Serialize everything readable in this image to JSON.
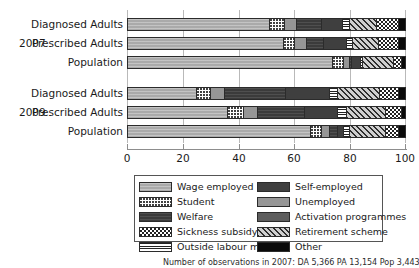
{
  "chart_data": {
    "type": "bar",
    "orientation": "horizontal",
    "stacked": true,
    "normalized_percent": true,
    "title": "",
    "xlabel": "",
    "ylabel": "",
    "xlim": [
      0,
      100
    ],
    "xticks": [
      0,
      20,
      40,
      60,
      80,
      100
    ],
    "xticklabels": [
      "0",
      "20",
      "40",
      "60",
      "80",
      "100"
    ],
    "grid": "vertical",
    "legend_position": "bottom",
    "groups": [
      {
        "year": "2007",
        "categories": [
          "Diagnosed Adults",
          "Prescribed Adults",
          "Population"
        ]
      },
      {
        "year": "2009",
        "categories": [
          "Diagnosed Adults",
          "Prescribed Adults",
          "Population"
        ]
      }
    ],
    "categories": [
      "2007 Diagnosed Adults",
      "2007 Prescribed Adults",
      "2007 Population",
      "2009 Diagnosed Adults",
      "2009 Prescribed Adults",
      "2009 Population"
    ],
    "series": [
      {
        "name": "Wage employed",
        "key": "wage",
        "values": [
          46,
          54,
          74,
          25,
          36,
          66
        ]
      },
      {
        "name": "Student",
        "key": "student",
        "values": [
          5,
          4,
          4,
          5,
          6,
          4
        ]
      },
      {
        "name": "Unemployed",
        "key": "unemployed",
        "values": [
          4,
          4,
          2,
          5,
          5,
          3
        ]
      },
      {
        "name": "Welfare",
        "key": "welfare",
        "values": [
          8,
          6,
          1,
          22,
          17,
          3
        ]
      },
      {
        "name": "Self-employed",
        "key": "selfemployed",
        "values": [
          7,
          8,
          3,
          16,
          12,
          2
        ]
      },
      {
        "name": "Outside labour market",
        "key": "outside",
        "values": [
          2,
          2,
          1,
          3,
          3,
          2
        ]
      },
      {
        "name": "Retirement scheme",
        "key": "retirement",
        "values": [
          9,
          9,
          11,
          15,
          14,
          13
        ]
      },
      {
        "name": "Sickness subsidy",
        "key": "sickness",
        "values": [
          7,
          7,
          3,
          7,
          6,
          5
        ]
      },
      {
        "name": "Other",
        "key": "other",
        "values": [
          2,
          2,
          1,
          2,
          1,
          2
        ]
      }
    ],
    "stack_order": [
      "wage",
      "student",
      "unemployed",
      "welfare",
      "selfemployed",
      "activation",
      "outside",
      "retirement",
      "sickness",
      "other"
    ],
    "bars": [
      {
        "label": "2007 Diagnosed Adults",
        "segments": [
          {
            "key": "wage",
            "value": 46
          },
          {
            "key": "student",
            "value": 5
          },
          {
            "key": "unemployed",
            "value": 4
          },
          {
            "key": "welfare",
            "value": 8
          },
          {
            "key": "selfemployed",
            "value": 7
          },
          {
            "key": "outside",
            "value": 2
          },
          {
            "key": "retirement",
            "value": 9
          },
          {
            "key": "sickness",
            "value": 7
          },
          {
            "key": "other",
            "value": 2
          }
        ]
      },
      {
        "label": "2007 Prescribed Adults",
        "segments": [
          {
            "key": "wage",
            "value": 54
          },
          {
            "key": "student",
            "value": 4
          },
          {
            "key": "unemployed",
            "value": 4
          },
          {
            "key": "welfare",
            "value": 6
          },
          {
            "key": "selfemployed",
            "value": 8
          },
          {
            "key": "outside",
            "value": 2
          },
          {
            "key": "retirement",
            "value": 9
          },
          {
            "key": "sickness",
            "value": 7
          },
          {
            "key": "other",
            "value": 2
          }
        ]
      },
      {
        "label": "2007 Population",
        "segments": [
          {
            "key": "wage",
            "value": 74
          },
          {
            "key": "student",
            "value": 4
          },
          {
            "key": "unemployed",
            "value": 2
          },
          {
            "key": "welfare",
            "value": 1
          },
          {
            "key": "selfemployed",
            "value": 3
          },
          {
            "key": "outside",
            "value": 1
          },
          {
            "key": "retirement",
            "value": 11
          },
          {
            "key": "sickness",
            "value": 3
          },
          {
            "key": "other",
            "value": 1
          }
        ]
      },
      {
        "label": "2009 Diagnosed Adults",
        "segments": [
          {
            "key": "wage",
            "value": 25
          },
          {
            "key": "student",
            "value": 5
          },
          {
            "key": "unemployed",
            "value": 5
          },
          {
            "key": "welfare",
            "value": 22
          },
          {
            "key": "selfemployed",
            "value": 16
          },
          {
            "key": "outside",
            "value": 3
          },
          {
            "key": "retirement",
            "value": 15
          },
          {
            "key": "sickness",
            "value": 7
          },
          {
            "key": "other",
            "value": 2
          }
        ]
      },
      {
        "label": "2009 Prescribed Adults",
        "segments": [
          {
            "key": "wage",
            "value": 36
          },
          {
            "key": "student",
            "value": 6
          },
          {
            "key": "unemployed",
            "value": 5
          },
          {
            "key": "welfare",
            "value": 17
          },
          {
            "key": "selfemployed",
            "value": 12
          },
          {
            "key": "outside",
            "value": 3
          },
          {
            "key": "retirement",
            "value": 14
          },
          {
            "key": "sickness",
            "value": 6
          },
          {
            "key": "other",
            "value": 1
          }
        ]
      },
      {
        "label": "2009 Population",
        "segments": [
          {
            "key": "wage",
            "value": 66
          },
          {
            "key": "student",
            "value": 4
          },
          {
            "key": "unemployed",
            "value": 3
          },
          {
            "key": "welfare",
            "value": 3
          },
          {
            "key": "selfemployed",
            "value": 2
          },
          {
            "key": "outside",
            "value": 2
          },
          {
            "key": "retirement",
            "value": 13
          },
          {
            "key": "sickness",
            "value": 5
          },
          {
            "key": "other",
            "value": 2
          }
        ]
      }
    ],
    "legend": [
      {
        "label": "Wage employed",
        "key": "wage"
      },
      {
        "label": "Self-employed",
        "key": "selfemployed"
      },
      {
        "label": "Student",
        "key": "student"
      },
      {
        "label": "Unemployed",
        "key": "unemployed"
      },
      {
        "label": "Welfare",
        "key": "welfare"
      },
      {
        "label": "Activation programmes",
        "key": "activation"
      },
      {
        "label": "Sickness subsidy",
        "key": "sickness"
      },
      {
        "label": "Retirement scheme",
        "key": "retirement"
      },
      {
        "label": "Outside labour market",
        "key": "outside"
      },
      {
        "label": "Other",
        "key": "other"
      }
    ]
  },
  "axis": {
    "group_2007": "2007",
    "group_2009": "2009",
    "cat_diagnosed": "Diagnosed Adults",
    "cat_prescribed": "Prescribed Adults",
    "cat_population": "Population",
    "t0": "0",
    "t20": "20",
    "t40": "40",
    "t60": "60",
    "t80": "80",
    "t100": "100"
  },
  "caption": {
    "text": "Number of observations in 2007: DA 5,366   PA 13,154   Pop 3,443,907"
  },
  "colors": {
    "wage": "#aaaaaa",
    "student": "#ffffff",
    "welfare": "#3b3b3b",
    "sickness": "#ffffff",
    "outside": "#ffffff",
    "selfemployed": "#3f3f3f",
    "unemployed": "#969696",
    "activation": "#5d5d5d",
    "retirement": "#cfcfcf",
    "other": "#0a0a0a",
    "gridline": "#b9b9b9",
    "axis": "#8d8d8d",
    "text": "#1a1a1a"
  }
}
